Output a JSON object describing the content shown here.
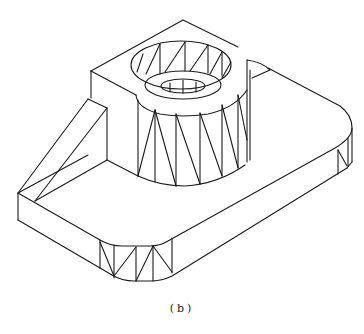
{
  "figure": {
    "caption": "(b)",
    "stroke_color": "#1a1a1a",
    "background": "#ffffff"
  }
}
